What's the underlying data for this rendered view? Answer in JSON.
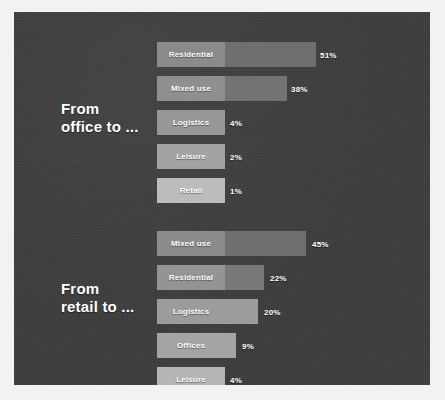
{
  "slide": {
    "background_color": "#3b3b3b",
    "page_color": "#f3f2f0",
    "label_text_color": "#ffffff"
  },
  "chart_data": {
    "type": "bar",
    "title": "",
    "xlabel": "",
    "ylabel": "",
    "orientation": "horizontal",
    "value_suffix": "%",
    "grid": false,
    "legend": "none",
    "xlim": [
      0,
      51
    ],
    "groups": [
      {
        "label": "From\noffice to ...",
        "label_line1": "From",
        "label_line2": "office to ...",
        "categories": [
          "Residential",
          "Mixed use",
          "Logistics",
          "Leisure",
          "Retail"
        ],
        "values": [
          51,
          38,
          4,
          2,
          1
        ],
        "value_labels": [
          "51%",
          "38%",
          "4%",
          "2%",
          "1%"
        ],
        "bar_colors": [
          "#8b8b8b",
          "#8f8f8f",
          "#979797",
          "#a3a3a3",
          "#bcbcbc"
        ],
        "extension_colors": [
          "#6f6f6f",
          "#737373",
          "",
          "",
          ""
        ]
      },
      {
        "label": "From\nretail to ...",
        "label_line1": "From",
        "label_line2": "retail to ...",
        "categories": [
          "Mixed use",
          "Residential",
          "Logistics",
          "Offices",
          "Leisure"
        ],
        "values": [
          45,
          22,
          20,
          9,
          4
        ],
        "value_labels": [
          "45%",
          "22%",
          "20%",
          "9%",
          "4%"
        ],
        "bar_colors": [
          "#8b8b8b",
          "#949494",
          "#9c9c9c",
          "#a5a5a5",
          "#b5b5b5"
        ],
        "extension_colors": [
          "#6f6f6f",
          "#787878",
          "",
          "",
          ""
        ]
      }
    ]
  },
  "geometry": {
    "bar_left": 143,
    "head_width": 68,
    "bar_height": 25,
    "rows": [
      {
        "group": 0,
        "index": 0,
        "top": 30,
        "total_width": 159,
        "value_x": 306
      },
      {
        "group": 0,
        "index": 1,
        "top": 64,
        "total_width": 130,
        "value_x": 277
      },
      {
        "group": 0,
        "index": 2,
        "top": 98,
        "total_width": 68,
        "value_x": 216
      },
      {
        "group": 0,
        "index": 3,
        "top": 132,
        "total_width": 68,
        "value_x": 216
      },
      {
        "group": 0,
        "index": 4,
        "top": 166,
        "total_width": 68,
        "value_x": 216
      },
      {
        "group": 1,
        "index": 0,
        "top": 219,
        "total_width": 149,
        "value_x": 298
      },
      {
        "group": 1,
        "index": 1,
        "top": 253,
        "total_width": 107,
        "value_x": 256
      },
      {
        "group": 1,
        "index": 2,
        "top": 287,
        "total_width": 101,
        "value_x": 250
      },
      {
        "group": 1,
        "index": 3,
        "top": 321,
        "total_width": 79,
        "value_x": 228
      },
      {
        "group": 1,
        "index": 4,
        "top": 355,
        "total_width": 68,
        "value_x": 216
      }
    ],
    "group_label_tops": [
      88,
      268
    ]
  }
}
